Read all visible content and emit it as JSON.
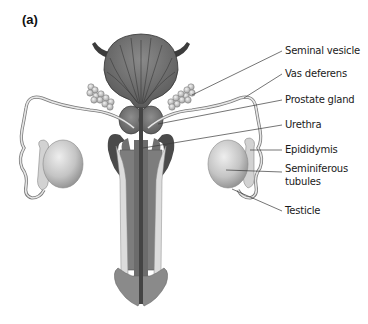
{
  "figure": {
    "panel_label": "(a)",
    "labels": {
      "seminal_vesicle": "Seminal vesicle",
      "vas_deferens": "Vas deferens",
      "prostate_gland": "Prostate gland",
      "urethra": "Urethra",
      "epididymis": "Epididymis",
      "seminiferous_tubules_line1": "Seminiferous",
      "seminiferous_tubules_line2": "tubules",
      "testicle": "Testicle"
    },
    "colors": {
      "bladder": "#6a6a6a",
      "dark": "#4a4a4a",
      "mid": "#8a8a8a",
      "light": "#d8d8d8",
      "testis": "#bdbdbd",
      "leader_line": "#3a3a3a"
    }
  }
}
